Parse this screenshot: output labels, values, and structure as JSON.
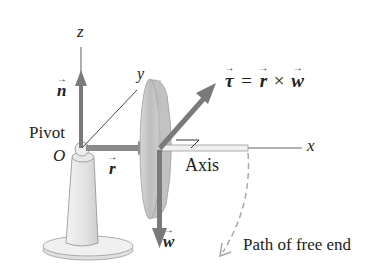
{
  "figure": {
    "type": "physics-diagram",
    "labels": {
      "z_axis": "z",
      "y_axis": "y",
      "x_axis": "x",
      "n_vector": "n",
      "pivot": "Pivot",
      "origin": "O",
      "r_vector": "r",
      "w_vector": "w",
      "axis": "Axis",
      "torque_eq_tau": "τ",
      "torque_eq_equals": "=",
      "torque_eq_r": "r",
      "torque_eq_times": "×",
      "torque_eq_w": "w",
      "path": "Path of free end"
    },
    "colors": {
      "vector_arrow": "#7a7a7a",
      "axis_line": "#555555",
      "disk_fill": "#c9c9c9",
      "disk_edge": "#a8a8a8",
      "pedestal_fill": "#e6e6e6",
      "dashed_path": "#b0b0b0",
      "text": "#222222"
    }
  }
}
